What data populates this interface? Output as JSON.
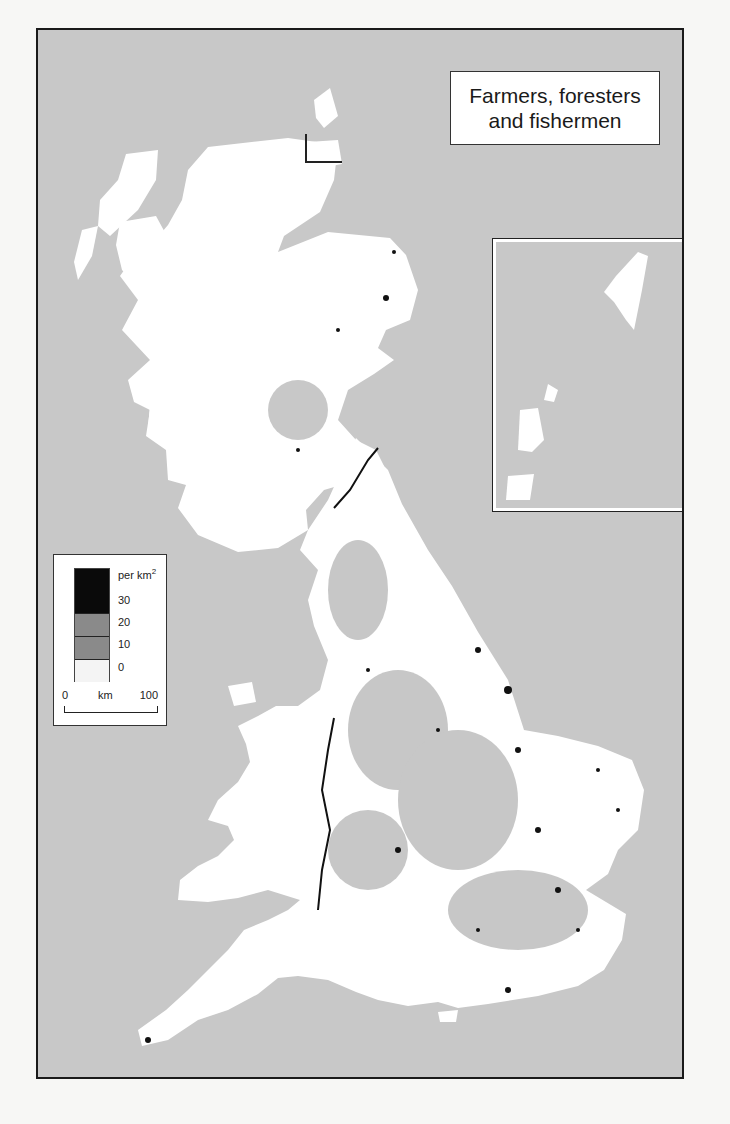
{
  "map": {
    "title_line1": "Farmers, foresters",
    "title_line2": "and fishermen",
    "region": "Great Britain",
    "inset": "Orkney and Shetland",
    "colors": {
      "sea": "#c8c8c8",
      "land_zero": "#ffffff",
      "class_10_20": "#8c8c8c",
      "class_20_30": "#8c8c8c",
      "class_30_plus": "#0a0a0a",
      "border": "#1a1a1a"
    }
  },
  "legend": {
    "unit": "per km",
    "unit_superscript": "2",
    "classes": [
      {
        "label": "30",
        "color": "#0a0a0a"
      },
      {
        "label": "20",
        "color": "#8a8a8a"
      },
      {
        "label": "10",
        "color": "#8a8a8a"
      },
      {
        "label": "0",
        "color": "#f4f4f4"
      }
    ],
    "break_labels": [
      "30",
      "20",
      "10",
      "0"
    ]
  },
  "scale_bar": {
    "start": "0",
    "unit": "km",
    "end": "100"
  }
}
